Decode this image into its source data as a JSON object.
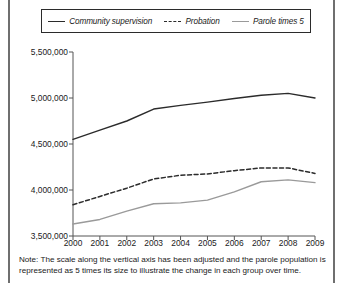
{
  "legend": {
    "items": [
      {
        "label": "Community supervision",
        "style": "solid",
        "color": "#2b2b2b",
        "icon": "line-solid-icon"
      },
      {
        "label": "Probation",
        "style": "dashed",
        "color": "#2b2b2b",
        "icon": "line-dashed-icon"
      },
      {
        "label": "Parole times 5",
        "style": "solid-light",
        "color": "#9a9a9a",
        "icon": "line-light-icon"
      }
    ]
  },
  "note": "Note: The scale along the vertical axis has been adjusted and the parole population is represented as 5 times its size to illustrate the change in each group over time.",
  "chart_data": {
    "type": "line",
    "title": "",
    "xlabel": "",
    "ylabel": "",
    "x": [
      2000,
      2001,
      2002,
      2003,
      2004,
      2005,
      2006,
      2007,
      2008,
      2009
    ],
    "categories": [
      "2000",
      "2001",
      "2002",
      "2003",
      "2004",
      "2005",
      "2006",
      "2007",
      "2008",
      "2009"
    ],
    "ylim": [
      3500000,
      5500000
    ],
    "yticks": [
      3500000,
      4000000,
      4500000,
      5000000,
      5500000
    ],
    "ytick_labels": [
      "3,500,000",
      "4,000,000",
      "4,500,000",
      "5,000,000",
      "5,500,000"
    ],
    "grid": false,
    "legend_position": "top",
    "series": [
      {
        "name": "Community supervision",
        "color": "#2b2b2b",
        "style": "solid",
        "values": [
          4550000,
          4650000,
          4750000,
          4880000,
          4920000,
          4955000,
          4995000,
          5030000,
          5050000,
          5000000
        ]
      },
      {
        "name": "Probation",
        "color": "#2b2b2b",
        "style": "dashed",
        "values": [
          3840000,
          3930000,
          4020000,
          4120000,
          4160000,
          4175000,
          4210000,
          4240000,
          4240000,
          4180000
        ]
      },
      {
        "name": "Parole times 5",
        "color": "#9a9a9a",
        "style": "solid",
        "values": [
          3630000,
          3680000,
          3770000,
          3850000,
          3860000,
          3890000,
          3980000,
          4090000,
          4110000,
          4080000
        ]
      }
    ]
  }
}
